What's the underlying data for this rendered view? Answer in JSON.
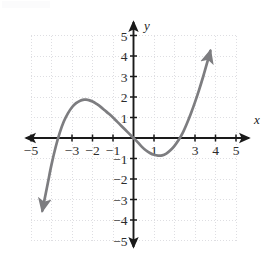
{
  "chart_data": {
    "type": "line",
    "title": "",
    "subtitle": "",
    "xlabel": "x",
    "ylabel": "y",
    "xlim": [
      -5,
      5
    ],
    "ylim": [
      -5,
      5
    ],
    "grid": true,
    "grid_style": "dotted",
    "grid_spacing": 1,
    "legend": "none",
    "axis_arrows": true,
    "curve_arrows": [
      "start",
      "end"
    ],
    "curve_color": "#7d7d80",
    "axis_color": "#1a1a1a",
    "grid_color": "#dedee2",
    "background": "#ffffff",
    "x_ticks": [
      -5,
      -4,
      -3,
      -2,
      -1,
      0,
      1,
      2,
      3,
      4,
      5
    ],
    "x_tick_labels": [
      "-5",
      "",
      "-3",
      "-2",
      "-1",
      "",
      "1",
      "",
      "3",
      "4",
      "5"
    ],
    "y_ticks": [
      -5,
      -4,
      -3,
      -2,
      -1,
      0,
      1,
      2,
      3,
      4,
      5
    ],
    "y_tick_labels": [
      "-5",
      "-4",
      "-3",
      "-2",
      "-1",
      "",
      "1",
      "2",
      "3",
      "4",
      "5"
    ],
    "features": {
      "x_intercepts": [
        -3.9,
        0,
        2.55
      ],
      "y_intercept": 0,
      "local_maximum": [
        -2.3,
        1.85
      ],
      "local_minimum": [
        1.3,
        -0.85
      ]
    },
    "points": [
      [
        -4.45,
        -3.55
      ],
      [
        -4.2,
        -2.3
      ],
      [
        -4.0,
        -1.3
      ],
      [
        -3.8,
        -0.45
      ],
      [
        -3.6,
        0.25
      ],
      [
        -3.4,
        0.8
      ],
      [
        -3.2,
        1.2
      ],
      [
        -3.0,
        1.5
      ],
      [
        -2.8,
        1.7
      ],
      [
        -2.6,
        1.82
      ],
      [
        -2.4,
        1.87
      ],
      [
        -2.3,
        1.87
      ],
      [
        -2.2,
        1.85
      ],
      [
        -2.0,
        1.78
      ],
      [
        -1.8,
        1.66
      ],
      [
        -1.6,
        1.52
      ],
      [
        -1.4,
        1.35
      ],
      [
        -1.2,
        1.18
      ],
      [
        -1.0,
        1.0
      ],
      [
        -0.8,
        0.8
      ],
      [
        -0.6,
        0.6
      ],
      [
        -0.4,
        0.4
      ],
      [
        -0.2,
        0.2
      ],
      [
        0.0,
        0.0
      ],
      [
        0.2,
        -0.2
      ],
      [
        0.4,
        -0.42
      ],
      [
        0.6,
        -0.6
      ],
      [
        0.8,
        -0.73
      ],
      [
        1.0,
        -0.82
      ],
      [
        1.2,
        -0.86
      ],
      [
        1.4,
        -0.85
      ],
      [
        1.6,
        -0.76
      ],
      [
        1.8,
        -0.6
      ],
      [
        2.0,
        -0.38
      ],
      [
        2.2,
        -0.1
      ],
      [
        2.4,
        0.25
      ],
      [
        2.6,
        0.7
      ],
      [
        2.8,
        1.2
      ],
      [
        3.0,
        1.75
      ],
      [
        3.2,
        2.35
      ],
      [
        3.4,
        3.0
      ],
      [
        3.6,
        3.7
      ],
      [
        3.75,
        4.25
      ]
    ]
  }
}
